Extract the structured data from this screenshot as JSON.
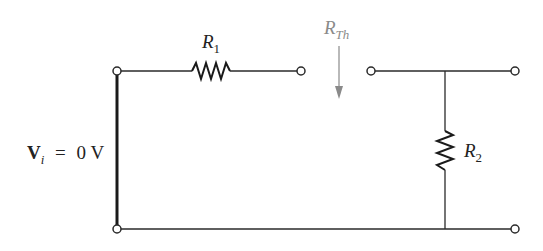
{
  "diagram": {
    "type": "circuit-schematic",
    "source_label": {
      "symbol": "V",
      "subscript": "i",
      "equals": "=",
      "value": "0 V"
    },
    "resistors": [
      {
        "id": "R1",
        "symbol": "R",
        "subscript": "1",
        "orientation": "horizontal",
        "position": "top-left branch"
      },
      {
        "id": "R2",
        "symbol": "R",
        "subscript": "2",
        "orientation": "vertical",
        "position": "shunt right branch"
      }
    ],
    "thevenin_label": {
      "symbol": "R",
      "subscript": "Th",
      "color": "#8a8a8a",
      "arrow": "down"
    },
    "terminals": [
      {
        "id": "input-top",
        "x": 117,
        "y": 71
      },
      {
        "id": "input-bottom",
        "x": 117,
        "y": 229
      },
      {
        "id": "open-left",
        "x": 301,
        "y": 71
      },
      {
        "id": "open-right",
        "x": 371,
        "y": 71
      },
      {
        "id": "output-top",
        "x": 515,
        "y": 71
      },
      {
        "id": "output-bottom",
        "x": 515,
        "y": 229
      }
    ],
    "colors": {
      "wire": "#2a2a2a",
      "short": "#1a1a1a",
      "annotation": "#8a8a8a",
      "background": "#ffffff"
    }
  }
}
